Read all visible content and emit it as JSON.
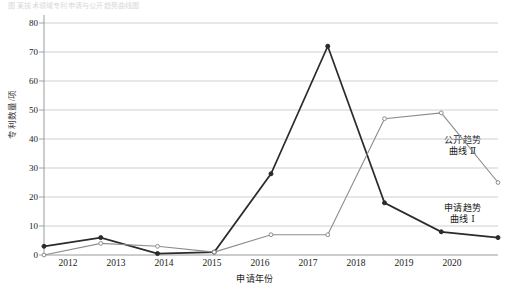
{
  "top_caption": "图 某技术领域专利申请与公开趋势曲线图",
  "axes": {
    "y_title": "专利数量/项",
    "x_title": "申请年份",
    "y_ticks": [
      "0",
      "10",
      "20",
      "30",
      "40",
      "50",
      "60",
      "70",
      "80"
    ],
    "x_ticks": [
      "2012",
      "2013",
      "2014",
      "2015",
      "2016",
      "2017",
      "2018",
      "2019",
      "2020"
    ]
  },
  "labels": {
    "grey_line1": "公开趋势",
    "grey_line2": "曲线 Ⅱ",
    "dark_line1": "申请趋势",
    "dark_line2": "曲线 Ⅰ"
  },
  "colors": {
    "dark_series": "#2b2b2b",
    "grey_series": "#8c8c8c",
    "gridline": "#c9c9c9",
    "axis": "#9a9a9a",
    "text": "#1a1a1a"
  },
  "chart_data": {
    "type": "line",
    "title": "图 某技术领域专利申请与公开趋势曲线图",
    "xlabel": "申请年份",
    "ylabel": "专利数量/项",
    "x": [
      "2012",
      "2013",
      "2014",
      "2015",
      "2016",
      "2017",
      "2018",
      "2019",
      "2020"
    ],
    "ylim": [
      0,
      80
    ],
    "xlim": [
      "2012",
      "2020"
    ],
    "y_ticks": [
      0,
      10,
      20,
      30,
      40,
      50,
      60,
      70,
      80
    ],
    "grid": "horizontal",
    "legend_position": "right-inline-annotation",
    "series": [
      {
        "name": "申请趋势曲线Ⅰ",
        "color": "#2b2b2b",
        "marker": "filled-circle",
        "values": [
          3,
          6,
          0.5,
          1,
          28,
          72,
          18,
          8,
          6
        ]
      },
      {
        "name": "公开趋势曲线Ⅱ",
        "color": "#8c8c8c",
        "marker": "open-circle",
        "values": [
          0,
          4,
          3,
          1,
          7,
          7,
          47,
          49,
          25
        ]
      }
    ]
  }
}
